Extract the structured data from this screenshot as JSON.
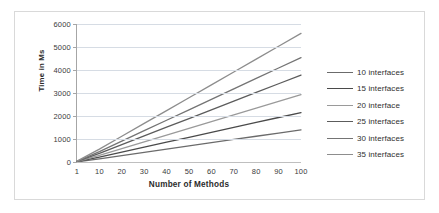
{
  "chart_data": {
    "type": "line",
    "title": "",
    "xlabel": "Number of Methods",
    "ylabel": "Time in Ms",
    "categories": [
      "1",
      "10",
      "20",
      "30",
      "40",
      "50",
      "60",
      "70",
      "80",
      "90",
      "100"
    ],
    "ylim": [
      0,
      6000
    ],
    "ytick_labels": [
      "6000",
      "5000",
      "4000",
      "3000",
      "2000",
      "1000",
      "0"
    ],
    "yticks": [
      6000,
      5000,
      4000,
      3000,
      2000,
      1000,
      0
    ],
    "grid": true,
    "legend_position": "right",
    "series": [
      {
        "name": "10 interfaces",
        "color": "#6b6b6b",
        "values": [
          10,
          140,
          280,
          420,
          560,
          700,
          840,
          980,
          1120,
          1260,
          1400
        ]
      },
      {
        "name": "15 interfaces",
        "color": "#4a4a4a",
        "values": [
          15,
          215,
          430,
          645,
          860,
          1075,
          1290,
          1505,
          1720,
          1935,
          2150
        ]
      },
      {
        "name": "20 interface",
        "color": "#9a9a9a",
        "values": [
          20,
          293,
          586,
          879,
          1172,
          1465,
          1758,
          2051,
          2344,
          2637,
          2930
        ]
      },
      {
        "name": "25 interfaces",
        "color": "#5c5c5c",
        "values": [
          25,
          378,
          756,
          1134,
          1512,
          1890,
          2268,
          2646,
          3024,
          3402,
          3780
        ]
      },
      {
        "name": "30 interfaces",
        "color": "#747474",
        "values": [
          30,
          454,
          908,
          1362,
          1816,
          2270,
          2724,
          3178,
          3632,
          4086,
          4540
        ]
      },
      {
        "name": "35 interfaces",
        "color": "#8d8d8d",
        "values": [
          35,
          559,
          1118,
          1677,
          2236,
          2795,
          3354,
          3913,
          4472,
          5031,
          5590
        ]
      }
    ]
  },
  "legend": {
    "items": [
      {
        "label": "10 interfaces"
      },
      {
        "label": "15 interfaces"
      },
      {
        "label": "20 interface"
      },
      {
        "label": "25 interfaces"
      },
      {
        "label": "30 interfaces"
      },
      {
        "label": "35 interfaces"
      }
    ]
  }
}
